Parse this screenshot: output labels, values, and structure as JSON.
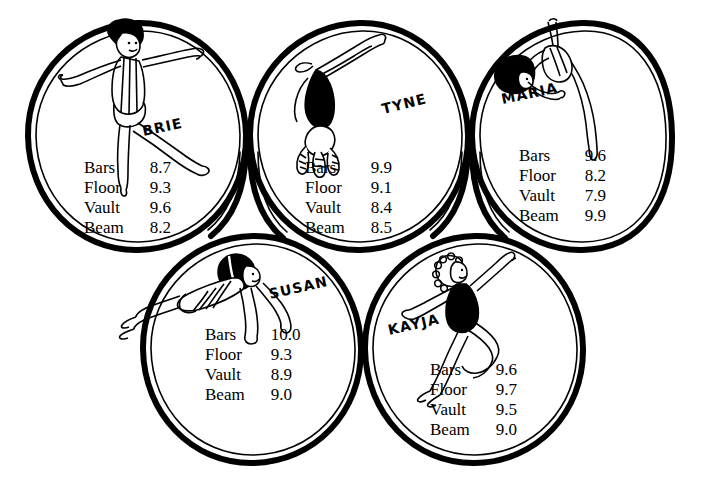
{
  "figure": {
    "ink_color": "#000000",
    "background_color": "#ffffff"
  },
  "score_columns": [
    "Bars",
    "Floor",
    "Vault",
    "Beam"
  ],
  "gymnasts": [
    {
      "name": "BRIE",
      "pose": "standing-arms-out-leg-extended",
      "scores": {
        "Bars": "8.7",
        "Floor": "9.3",
        "Vault": "9.6",
        "Beam": "8.2"
      }
    },
    {
      "name": "TYNE",
      "pose": "inverted-handstand-dismount",
      "scores": {
        "Bars": "9.9",
        "Floor": "9.1",
        "Vault": "8.4",
        "Beam": "8.5"
      }
    },
    {
      "name": "MARIA",
      "pose": "inverted-arch-over-bar",
      "scores": {
        "Bars": "9.6",
        "Floor": "8.2",
        "Vault": "7.9",
        "Beam": "9.9"
      }
    },
    {
      "name": "SUSAN",
      "pose": "horizontal-planche",
      "scores": {
        "Bars": "10.0",
        "Floor": "9.3",
        "Vault": "8.9",
        "Beam": "9.0"
      }
    },
    {
      "name": "KAYJA",
      "pose": "leap-arms-raised",
      "scores": {
        "Bars": "9.6",
        "Floor": "9.7",
        "Vault": "9.5",
        "Beam": "9.0"
      }
    }
  ]
}
